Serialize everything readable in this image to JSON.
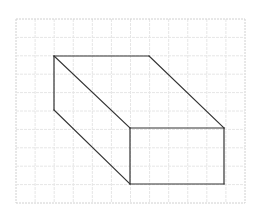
{
  "diagram": {
    "type": "isometric-grid-prism",
    "grid": {
      "x_start": 16,
      "y_start": 19,
      "x_end": 245,
      "y_end": 203,
      "cols": 12,
      "rows": 10,
      "line_color": "#e6e6e6",
      "border_color": "#d0d0d0",
      "dashed": true
    },
    "prism": {
      "stroke_color": "#333333",
      "stroke_width": 1.2,
      "vertices": {
        "back_top_left": [
          54,
          56
        ],
        "back_top_right": [
          149,
          56
        ],
        "back_bottom_left": [
          54,
          110
        ],
        "front_top_left": [
          130,
          128
        ],
        "front_top_right": [
          224,
          128
        ],
        "front_bottom_left": [
          130,
          184
        ],
        "front_bottom_right": [
          224,
          184
        ]
      },
      "edges": [
        [
          "back_top_left",
          "back_top_right"
        ],
        [
          "back_top_left",
          "back_bottom_left"
        ],
        [
          "back_top_left",
          "front_top_left"
        ],
        [
          "back_top_right",
          "front_top_right"
        ],
        [
          "back_bottom_left",
          "front_bottom_left"
        ],
        [
          "front_top_left",
          "front_top_right"
        ],
        [
          "front_top_left",
          "front_bottom_left"
        ],
        [
          "front_top_right",
          "front_bottom_right"
        ],
        [
          "front_bottom_left",
          "front_bottom_right"
        ]
      ]
    }
  }
}
